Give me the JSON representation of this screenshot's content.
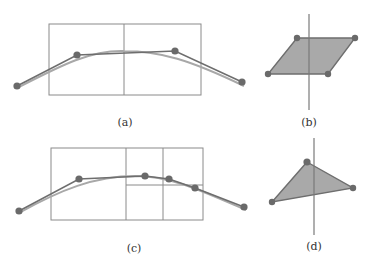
{
  "colors": {
    "grid": "#8a8a8a",
    "polyline": "#6e6e6e",
    "curve": "#a8a8a8",
    "point": "#6a6a6a",
    "fill": "#a9a9a9",
    "axis": "#7a7a7a"
  },
  "captions": {
    "a": "(a)",
    "b": "(b)",
    "c": "(c)",
    "d": "(d)"
  },
  "panels": {
    "a": {
      "box": [
        49,
        24,
        201,
        95
      ],
      "split_x": 124,
      "points": [
        [
          17,
          86
        ],
        [
          77,
          55
        ],
        [
          175,
          51
        ],
        [
          242,
          82
        ]
      ]
    },
    "b": {
      "axis": [
        309,
        14,
        309,
        110
      ],
      "points": [
        [
          297,
          38
        ],
        [
          355,
          38
        ],
        [
          328,
          74
        ],
        [
          268,
          74
        ]
      ]
    },
    "c": {
      "box": [
        51,
        148,
        203,
        220
      ],
      "splits_x": [
        126,
        163
      ],
      "split_y_line": [
        126,
        185,
        203,
        185
      ],
      "points": [
        [
          19,
          211
        ],
        [
          79,
          179
        ],
        [
          145,
          176
        ],
        [
          169,
          179
        ],
        [
          195,
          188
        ],
        [
          244,
          207
        ]
      ]
    },
    "d": {
      "axis": [
        314,
        138,
        314,
        235
      ],
      "points": [
        [
          307,
          162
        ],
        [
          353,
          188
        ],
        [
          272,
          202
        ]
      ]
    }
  }
}
